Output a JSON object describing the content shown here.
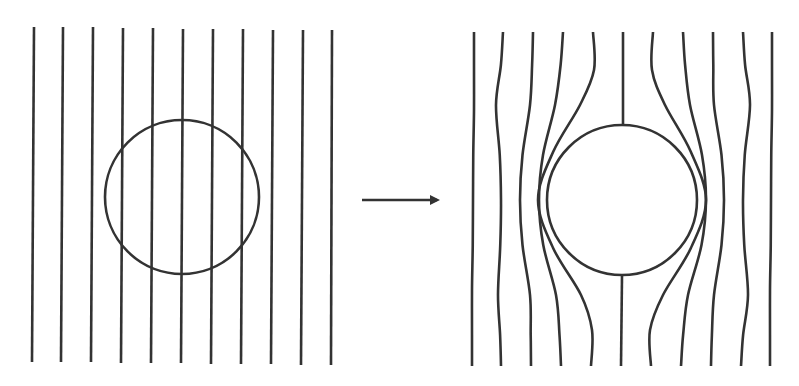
{
  "diagram": {
    "title": "Field lines expelled from a sphere",
    "stroke_color": "#333333",
    "background": "#ffffff",
    "stroke_width": 2.6,
    "left_panel": {
      "label": "before",
      "circle": {
        "cx": 182,
        "cy": 197,
        "r": 77
      },
      "lines": [
        {
          "x_top": 34,
          "y_top": 27,
          "x_bottom": 32,
          "y_bottom": 362
        },
        {
          "x_top": 63,
          "y_top": 27,
          "x_bottom": 61,
          "y_bottom": 362
        },
        {
          "x_top": 93,
          "y_top": 27,
          "x_bottom": 91,
          "y_bottom": 362
        },
        {
          "x_top": 123,
          "y_top": 28,
          "x_bottom": 121,
          "y_bottom": 363
        },
        {
          "x_top": 153,
          "y_top": 28,
          "x_bottom": 151,
          "y_bottom": 363
        },
        {
          "x_top": 183,
          "y_top": 29,
          "x_bottom": 181,
          "y_bottom": 363
        },
        {
          "x_top": 213,
          "y_top": 29,
          "x_bottom": 211,
          "y_bottom": 364
        },
        {
          "x_top": 243,
          "y_top": 29,
          "x_bottom": 241,
          "y_bottom": 364
        },
        {
          "x_top": 273,
          "y_top": 30,
          "x_bottom": 271,
          "y_bottom": 364
        },
        {
          "x_top": 303,
          "y_top": 30,
          "x_bottom": 301,
          "y_bottom": 365
        },
        {
          "x_top": 332,
          "y_top": 30,
          "x_bottom": 331,
          "y_bottom": 365
        }
      ]
    },
    "arrow": {
      "label": "transition arrow",
      "x1": 362,
      "y1": 200,
      "x2": 443,
      "y2": 200
    },
    "right_panel": {
      "label": "after",
      "circle": {
        "cx": 622,
        "cy": 200,
        "r": 75
      },
      "lines": [
        {
          "top": [
            474,
            32
          ],
          "mid_upper": [
            474,
            110
          ],
          "equator": [
            473,
            200
          ],
          "mid_lower": [
            472,
            290
          ],
          "bottom": [
            472,
            366
          ]
        },
        {
          "top": [
            503,
            32
          ],
          "mid_upper": [
            496,
            105
          ],
          "equator": [
            501,
            200
          ],
          "mid_lower": [
            498,
            295
          ],
          "bottom": [
            501,
            366
          ]
        },
        {
          "top": [
            533,
            32
          ],
          "mid_upper": [
            530,
            105
          ],
          "equator": [
            520,
            200
          ],
          "mid_lower": [
            530,
            295
          ],
          "bottom": [
            531,
            366
          ]
        },
        {
          "top": [
            563,
            32
          ],
          "mid_upper": [
            555,
            105
          ],
          "equator": [
            539,
            200
          ],
          "mid_lower": [
            556,
            295
          ],
          "bottom": [
            561,
            366
          ]
        },
        {
          "top": [
            593,
            32
          ],
          "mid_upper": [
            580,
            105
          ],
          "equator": [
            547,
            200
          ],
          "mid_lower": [
            581,
            295
          ],
          "bottom": [
            591,
            366
          ],
          "hugs_circle": true,
          "side": "left"
        },
        {
          "top": [
            623,
            32
          ],
          "stem_top_end": [
            623,
            124
          ],
          "stem_bottom_start": [
            622,
            276
          ],
          "bottom": [
            621,
            366
          ],
          "center_line": true
        },
        {
          "top": [
            653,
            32
          ],
          "mid_upper": [
            665,
            105
          ],
          "equator": [
            697,
            200
          ],
          "mid_lower": [
            663,
            295
          ],
          "bottom": [
            651,
            366
          ],
          "hugs_circle": true,
          "side": "right"
        },
        {
          "top": [
            683,
            32
          ],
          "mid_upper": [
            690,
            105
          ],
          "equator": [
            706,
            200
          ],
          "mid_lower": [
            688,
            295
          ],
          "bottom": [
            681,
            366
          ]
        },
        {
          "top": [
            713,
            32
          ],
          "mid_upper": [
            714,
            105
          ],
          "equator": [
            724,
            200
          ],
          "mid_lower": [
            714,
            295
          ],
          "bottom": [
            711,
            366
          ]
        },
        {
          "top": [
            743,
            32
          ],
          "mid_upper": [
            750,
            105
          ],
          "equator": [
            743,
            200
          ],
          "mid_lower": [
            748,
            295
          ],
          "bottom": [
            741,
            366
          ]
        },
        {
          "top": [
            772,
            32
          ],
          "mid_upper": [
            772,
            110
          ],
          "equator": [
            771,
            200
          ],
          "mid_lower": [
            770,
            290
          ],
          "bottom": [
            770,
            366
          ]
        }
      ]
    }
  }
}
